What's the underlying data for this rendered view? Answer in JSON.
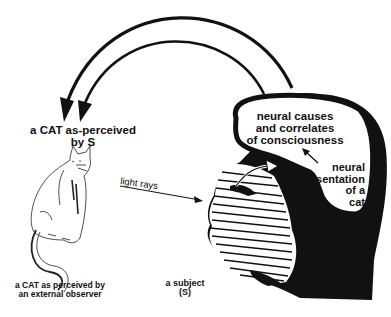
{
  "diagram": {
    "labels": {
      "cat_as_perceived_by_s": [
        "a CAT as-perceived",
        "by S"
      ],
      "cat_external_observer": [
        "a CAT as perceived by",
        "an external observer"
      ],
      "subject": [
        "a subject",
        "(S)"
      ],
      "light_rays": "light rays",
      "neural_causes": [
        "neural causes",
        "and correlates",
        "of consciousness"
      ],
      "neural_representation": [
        "neural",
        "representation",
        "of a",
        "cat"
      ]
    },
    "colors": {
      "ink": "#111111",
      "background": "#ffffff"
    },
    "elements": [
      {
        "id": "arc-outer",
        "type": "arrow",
        "from": "head",
        "to": "cat-as-perceived"
      },
      {
        "id": "arc-inner",
        "type": "arrow",
        "from": "head",
        "to": "cat-as-perceived"
      },
      {
        "id": "light-rays-arrow",
        "type": "arrow",
        "from": "cat",
        "to": "subject-eye"
      },
      {
        "id": "internal-arrow",
        "type": "arrow",
        "from": "eye",
        "to": "neural-representation"
      },
      {
        "id": "small-arrow",
        "type": "arrow",
        "from": "neural-representation",
        "to": "neural-causes"
      }
    ]
  }
}
